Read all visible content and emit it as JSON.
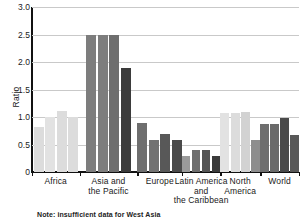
{
  "chart_data": {
    "type": "bar",
    "title": "",
    "xlabel": "",
    "ylabel": "Ratio",
    "ylim": [
      0,
      3.0
    ],
    "ytick_labels": [
      "3.0",
      "2.5",
      "2.0",
      "1.5",
      "1.0",
      "0.5",
      "0"
    ],
    "ytick_values": [
      3.0,
      2.5,
      2.0,
      1.5,
      1.0,
      0.5,
      0
    ],
    "grid": "horizontal",
    "legend": "none",
    "categories": [
      "Africa",
      "Asia and the Pacific",
      "Europe",
      "Latin America and the Caribbean",
      "North America",
      "World"
    ],
    "category_label_lines": [
      [
        "Africa"
      ],
      [
        "Asia and",
        "the Pacific"
      ],
      [
        "Europe"
      ],
      [
        "Latin America",
        "and",
        "the Caribbean"
      ],
      [
        "North",
        "America"
      ],
      [
        "World"
      ]
    ],
    "groups": [
      {
        "name": "Africa",
        "values": [
          0.82,
          1.0,
          1.11,
          1.0
        ],
        "colors": [
          "#dcdcdc",
          "#e2e2e2",
          "#dcdcdc",
          "#dcdcdc"
        ]
      },
      {
        "name": "Asia and the Pacific",
        "values": [
          2.5,
          2.5,
          2.5,
          1.9
        ],
        "colors": [
          "#7d7d7d",
          "#7d7d7d",
          "#6e6e6e",
          "#3b3b3b"
        ]
      },
      {
        "name": "Europe",
        "values": [
          0.89,
          0.59,
          0.7,
          0.59
        ],
        "colors": [
          "#6e6e6e",
          "#727272",
          "#585858",
          "#4a4a4a"
        ]
      },
      {
        "name": "Latin America and the Caribbean",
        "values": [
          0.3,
          0.4,
          0.4,
          0.29
        ],
        "colors": [
          "#9a9a9a",
          "#6e6e6e",
          "#555555",
          "#3b3b3b"
        ]
      },
      {
        "name": "North America",
        "values": [
          1.08,
          1.08,
          1.09,
          0.58
        ],
        "colors": [
          "#e2e2e2",
          "#dcdcdc",
          "#d2d2d2",
          "#8d8d8d"
        ]
      },
      {
        "name": "World",
        "values": [
          0.88,
          0.88,
          0.98,
          0.68
        ],
        "colors": [
          "#6e6e6e",
          "#6a6a6a",
          "#4a4a4a",
          "#585858"
        ]
      }
    ],
    "note": "Note: insufficient data for West Asia",
    "title_sliver": "and the Pacific"
  }
}
